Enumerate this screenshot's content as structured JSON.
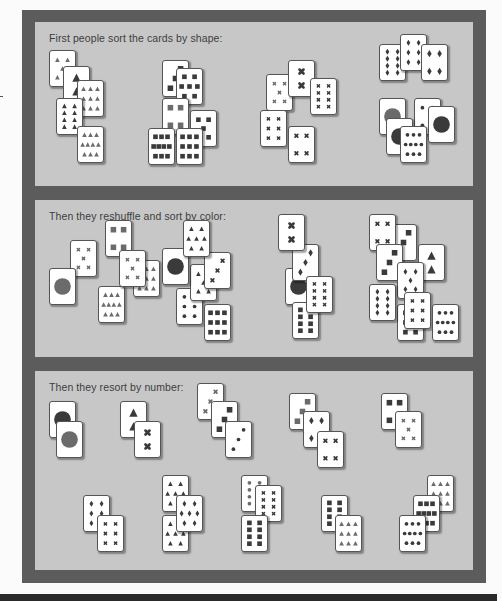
{
  "colors": {
    "frame": "#5c5c5c",
    "panel": "#c7c7c7",
    "card": "#ffffff",
    "symbol_dark": "#3a3a3a",
    "symbol_mid": "#6b6b6b"
  },
  "panels": [
    {
      "id": "shape",
      "caption": "First people sort the cards by shape:",
      "top": 12,
      "height": 164,
      "cards": [
        {
          "x": 14,
          "y": 28,
          "shape": "triangle",
          "count": 5,
          "color": "mid"
        },
        {
          "x": 28,
          "y": 44,
          "shape": "triangle",
          "count": 2,
          "color": "dark"
        },
        {
          "x": 42,
          "y": 58,
          "shape": "triangle",
          "count": 9,
          "color": "mid"
        },
        {
          "x": 21,
          "y": 76,
          "shape": "triangle",
          "count": 8,
          "color": "dark"
        },
        {
          "x": 42,
          "y": 104,
          "shape": "triangle",
          "count": 10,
          "color": "mid"
        },
        {
          "x": 127,
          "y": 38,
          "shape": "square",
          "count": 3,
          "color": "dark"
        },
        {
          "x": 141,
          "y": 46,
          "shape": "square",
          "count": 7,
          "color": "dark"
        },
        {
          "x": 127,
          "y": 76,
          "shape": "square",
          "count": 4,
          "color": "mid"
        },
        {
          "x": 155,
          "y": 88,
          "shape": "square",
          "count": 5,
          "color": "dark"
        },
        {
          "x": 113,
          "y": 106,
          "shape": "square",
          "count": 10,
          "color": "dark"
        },
        {
          "x": 141,
          "y": 106,
          "shape": "square",
          "count": 9,
          "color": "dark"
        },
        {
          "x": 231,
          "y": 52,
          "shape": "cross",
          "count": 5,
          "color": "mid"
        },
        {
          "x": 253,
          "y": 38,
          "shape": "cross",
          "count": 2,
          "color": "dark"
        },
        {
          "x": 275,
          "y": 56,
          "shape": "cross",
          "count": 8,
          "color": "dark"
        },
        {
          "x": 225,
          "y": 88,
          "shape": "cross",
          "count": 6,
          "color": "dark"
        },
        {
          "x": 253,
          "y": 104,
          "shape": "cross",
          "count": 4,
          "color": "dark"
        },
        {
          "x": 344,
          "y": 22,
          "shape": "diamond",
          "count": 8,
          "color": "dark"
        },
        {
          "x": 365,
          "y": 12,
          "shape": "diamond",
          "count": 6,
          "color": "dark"
        },
        {
          "x": 386,
          "y": 22,
          "shape": "diamond",
          "count": 4,
          "color": "dark"
        },
        {
          "x": 344,
          "y": 76,
          "shape": "circle",
          "count": 1,
          "color": "mid"
        },
        {
          "x": 379,
          "y": 76,
          "shape": "circle",
          "count": 4,
          "color": "dark"
        },
        {
          "x": 351,
          "y": 96,
          "shape": "circle",
          "count": 1,
          "color": "dark"
        },
        {
          "x": 365,
          "y": 104,
          "shape": "circle",
          "count": 10,
          "color": "dark"
        },
        {
          "x": 393,
          "y": 84,
          "shape": "circle",
          "count": 1,
          "color": "dark"
        }
      ]
    },
    {
      "id": "color",
      "caption": "Then they reshuffle and sort by color:",
      "top": 190,
      "height": 157,
      "cards": [
        {
          "x": 35,
          "y": 40,
          "shape": "cross",
          "count": 5,
          "color": "mid"
        },
        {
          "x": 70,
          "y": 20,
          "shape": "square",
          "count": 4,
          "color": "mid"
        },
        {
          "x": 63,
          "y": 86,
          "shape": "triangle",
          "count": 10,
          "color": "mid"
        },
        {
          "x": 98,
          "y": 60,
          "shape": "triangle",
          "count": 9,
          "color": "mid"
        },
        {
          "x": 84,
          "y": 50,
          "shape": "cross",
          "count": 5,
          "color": "mid"
        },
        {
          "x": 14,
          "y": 68,
          "shape": "circle",
          "count": 1,
          "color": "mid"
        },
        {
          "x": 141,
          "y": 88,
          "shape": "circle",
          "count": 6,
          "color": "dark"
        },
        {
          "x": 155,
          "y": 64,
          "shape": "triangle",
          "count": 5,
          "color": "dark"
        },
        {
          "x": 169,
          "y": 52,
          "shape": "cross",
          "count": 3,
          "color": "dark"
        },
        {
          "x": 127,
          "y": 48,
          "shape": "circle",
          "count": 1,
          "color": "dark"
        },
        {
          "x": 148,
          "y": 20,
          "shape": "triangle",
          "count": 7,
          "color": "dark"
        },
        {
          "x": 169,
          "y": 104,
          "shape": "square",
          "count": 9,
          "color": "dark"
        },
        {
          "x": 250,
          "y": 68,
          "shape": "circle",
          "count": 1,
          "color": "dark"
        },
        {
          "x": 257,
          "y": 102,
          "shape": "square",
          "count": 8,
          "color": "dark"
        },
        {
          "x": 257,
          "y": 44,
          "shape": "diamond",
          "count": 3,
          "color": "dark"
        },
        {
          "x": 271,
          "y": 76,
          "shape": "cross",
          "count": 8,
          "color": "dark"
        },
        {
          "x": 243,
          "y": 14,
          "shape": "cross",
          "count": 2,
          "color": "dark"
        },
        {
          "x": 355,
          "y": 24,
          "shape": "square",
          "count": 3,
          "color": "dark"
        },
        {
          "x": 334,
          "y": 14,
          "shape": "cross",
          "count": 4,
          "color": "dark"
        },
        {
          "x": 341,
          "y": 44,
          "shape": "square",
          "count": 3,
          "color": "dark"
        },
        {
          "x": 383,
          "y": 44,
          "shape": "triangle",
          "count": 2,
          "color": "dark"
        },
        {
          "x": 362,
          "y": 62,
          "shape": "diamond",
          "count": 5,
          "color": "dark"
        },
        {
          "x": 362,
          "y": 104,
          "shape": "square",
          "count": 6,
          "color": "dark"
        },
        {
          "x": 334,
          "y": 84,
          "shape": "diamond",
          "count": 8,
          "color": "dark"
        },
        {
          "x": 369,
          "y": 92,
          "shape": "cross",
          "count": 6,
          "color": "dark"
        },
        {
          "x": 397,
          "y": 104,
          "shape": "circle",
          "count": 10,
          "color": "dark"
        }
      ]
    },
    {
      "id": "number",
      "caption": "Then they resort by number:",
      "top": 361,
      "height": 199,
      "cards": [
        {
          "x": 14,
          "y": 30,
          "shape": "circle",
          "count": 1,
          "color": "dark"
        },
        {
          "x": 21,
          "y": 50,
          "shape": "circle",
          "count": 1,
          "color": "mid"
        },
        {
          "x": 85,
          "y": 30,
          "shape": "triangle",
          "count": 2,
          "color": "dark"
        },
        {
          "x": 99,
          "y": 50,
          "shape": "cross",
          "count": 2,
          "color": "dark"
        },
        {
          "x": 162,
          "y": 12,
          "shape": "cross",
          "count": 3,
          "color": "mid"
        },
        {
          "x": 176,
          "y": 30,
          "shape": "square",
          "count": 3,
          "color": "dark"
        },
        {
          "x": 190,
          "y": 50,
          "shape": "circle",
          "count": 3,
          "color": "dark"
        },
        {
          "x": 254,
          "y": 22,
          "shape": "square",
          "count": 3,
          "color": "mid"
        },
        {
          "x": 268,
          "y": 40,
          "shape": "diamond",
          "count": 4,
          "color": "dark"
        },
        {
          "x": 282,
          "y": 60,
          "shape": "cross",
          "count": 4,
          "color": "dark"
        },
        {
          "x": 346,
          "y": 22,
          "shape": "square",
          "count": 4,
          "color": "dark"
        },
        {
          "x": 360,
          "y": 40,
          "shape": "cross",
          "count": 5,
          "color": "mid"
        },
        {
          "x": 48,
          "y": 124,
          "shape": "diamond",
          "count": 6,
          "color": "dark"
        },
        {
          "x": 62,
          "y": 144,
          "shape": "cross",
          "count": 6,
          "color": "dark"
        },
        {
          "x": 127,
          "y": 104,
          "shape": "triangle",
          "count": 7,
          "color": "dark"
        },
        {
          "x": 127,
          "y": 144,
          "shape": "triangle",
          "count": 7,
          "color": "dark"
        },
        {
          "x": 141,
          "y": 124,
          "shape": "diamond",
          "count": 7,
          "color": "dark"
        },
        {
          "x": 206,
          "y": 104,
          "shape": "circle",
          "count": 8,
          "color": "mid"
        },
        {
          "x": 220,
          "y": 114,
          "shape": "cross",
          "count": 8,
          "color": "dark"
        },
        {
          "x": 206,
          "y": 144,
          "shape": "square",
          "count": 8,
          "color": "dark"
        },
        {
          "x": 286,
          "y": 124,
          "shape": "square",
          "count": 8,
          "color": "dark"
        },
        {
          "x": 300,
          "y": 144,
          "shape": "triangle",
          "count": 9,
          "color": "mid"
        },
        {
          "x": 392,
          "y": 104,
          "shape": "triangle",
          "count": 9,
          "color": "mid"
        },
        {
          "x": 378,
          "y": 124,
          "shape": "square",
          "count": 10,
          "color": "dark"
        },
        {
          "x": 364,
          "y": 144,
          "shape": "circle",
          "count": 10,
          "color": "dark"
        }
      ]
    }
  ]
}
